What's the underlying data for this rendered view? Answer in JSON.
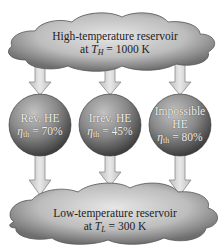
{
  "diagram": {
    "colors": {
      "cloud_fill_center": "#d8d8d8",
      "cloud_fill_edge": "#6e6e6e",
      "sphere_light": "#b8b8b8",
      "sphere_dark": "#4a4a4a",
      "arrow_fill": "#d9d9d9",
      "arrow_stroke": "#8a8a8a"
    },
    "high_reservoir": {
      "line1": "High-temperature reservoir",
      "line2_prefix": "at ",
      "symbol": "T",
      "subscript": "H",
      "line2_suffix": " = 1000 K"
    },
    "low_reservoir": {
      "line1": "Low-temperature reservoir",
      "line2_prefix": "at ",
      "symbol": "T",
      "subscript": "L",
      "line2_suffix": " = 300 K"
    },
    "engines": [
      {
        "name": "Rev. HE",
        "eta_symbol": "η",
        "eta_sub": "th",
        "eta_value": " = 70%"
      },
      {
        "name": "Irrev. HE",
        "eta_symbol": "η",
        "eta_sub": "th",
        "eta_value": " = 45%"
      },
      {
        "name": "Impossible HE",
        "name_line1": "Impossible",
        "name_line2": "HE",
        "eta_symbol": "η",
        "eta_sub": "th",
        "eta_value": " = 80%"
      }
    ]
  }
}
